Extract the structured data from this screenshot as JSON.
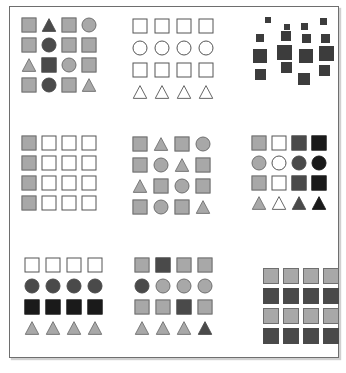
{
  "figure": {
    "width": 346,
    "height": 373,
    "frame": {
      "border_color": "#6e6e6e",
      "background": "#ffffff",
      "shadow_color": "#aaaaaa"
    },
    "palette": {
      "white": "#ffffff",
      "light_gray": "#a8a8a8",
      "mid_gray": "#8f8f8f",
      "dark_gray": "#4a4a4a",
      "darker_gray": "#3c3c3c",
      "black": "#1a1a1a",
      "outline": "#555555"
    },
    "legend_note": "Shapes: square, circle, triangle. Fills: white, light gray, dark gray, black."
  },
  "panels": [
    {
      "id": "panel-1",
      "position": "top-left",
      "label": "Mixed shapes, mixed fills",
      "layout": "grid-4x4",
      "rows": [
        [
          {
            "shape": "square",
            "fill": "light_gray"
          },
          {
            "shape": "triangle",
            "fill": "dark_gray"
          },
          {
            "shape": "square",
            "fill": "light_gray"
          },
          {
            "shape": "circle",
            "fill": "light_gray"
          }
        ],
        [
          {
            "shape": "square",
            "fill": "light_gray"
          },
          {
            "shape": "circle",
            "fill": "dark_gray"
          },
          {
            "shape": "square",
            "fill": "light_gray"
          },
          {
            "shape": "square",
            "fill": "light_gray"
          }
        ],
        [
          {
            "shape": "triangle",
            "fill": "light_gray"
          },
          {
            "shape": "square",
            "fill": "dark_gray"
          },
          {
            "shape": "circle",
            "fill": "light_gray"
          },
          {
            "shape": "square",
            "fill": "light_gray"
          }
        ],
        [
          {
            "shape": "square",
            "fill": "light_gray"
          },
          {
            "shape": "circle",
            "fill": "dark_gray"
          },
          {
            "shape": "square",
            "fill": "light_gray"
          },
          {
            "shape": "triangle",
            "fill": "light_gray"
          }
        ]
      ]
    },
    {
      "id": "panel-2",
      "position": "top-center",
      "label": "Uniform outlined shapes by row",
      "layout": "grid-4x4",
      "rows": [
        [
          {
            "shape": "square",
            "fill": "white"
          },
          {
            "shape": "square",
            "fill": "white"
          },
          {
            "shape": "square",
            "fill": "white"
          },
          {
            "shape": "square",
            "fill": "white"
          }
        ],
        [
          {
            "shape": "circle",
            "fill": "white"
          },
          {
            "shape": "circle",
            "fill": "white"
          },
          {
            "shape": "circle",
            "fill": "white"
          },
          {
            "shape": "circle",
            "fill": "white"
          }
        ],
        [
          {
            "shape": "square",
            "fill": "white"
          },
          {
            "shape": "square",
            "fill": "white"
          },
          {
            "shape": "square",
            "fill": "white"
          },
          {
            "shape": "square",
            "fill": "white"
          }
        ],
        [
          {
            "shape": "triangle",
            "fill": "white"
          },
          {
            "shape": "triangle",
            "fill": "white"
          },
          {
            "shape": "triangle",
            "fill": "white"
          },
          {
            "shape": "triangle",
            "fill": "white"
          }
        ]
      ]
    },
    {
      "id": "panel-3",
      "position": "top-right",
      "label": "Scattered dark squares of varying size",
      "layout": "scatter",
      "items": [
        {
          "shape": "square",
          "fill": "darker_gray",
          "x": 14,
          "y": 2,
          "size": 6
        },
        {
          "shape": "square",
          "fill": "darker_gray",
          "x": 33,
          "y": 9,
          "size": 6
        },
        {
          "shape": "square",
          "fill": "darker_gray",
          "x": 50,
          "y": 8,
          "size": 7
        },
        {
          "shape": "square",
          "fill": "darker_gray",
          "x": 69,
          "y": 3,
          "size": 7
        },
        {
          "shape": "square",
          "fill": "darker_gray",
          "x": 5,
          "y": 19,
          "size": 8
        },
        {
          "shape": "square",
          "fill": "darker_gray",
          "x": 30,
          "y": 16,
          "size": 10
        },
        {
          "shape": "square",
          "fill": "darker_gray",
          "x": 51,
          "y": 19,
          "size": 9
        },
        {
          "shape": "square",
          "fill": "darker_gray",
          "x": 70,
          "y": 19,
          "size": 9
        },
        {
          "shape": "square",
          "fill": "darker_gray",
          "x": 2,
          "y": 34,
          "size": 14
        },
        {
          "shape": "square",
          "fill": "darker_gray",
          "x": 26,
          "y": 30,
          "size": 15
        },
        {
          "shape": "square",
          "fill": "darker_gray",
          "x": 48,
          "y": 34,
          "size": 14
        },
        {
          "shape": "square",
          "fill": "darker_gray",
          "x": 68,
          "y": 31,
          "size": 15
        },
        {
          "shape": "square",
          "fill": "darker_gray",
          "x": 30,
          "y": 47,
          "size": 11
        },
        {
          "shape": "square",
          "fill": "darker_gray",
          "x": 4,
          "y": 54,
          "size": 11
        },
        {
          "shape": "square",
          "fill": "darker_gray",
          "x": 68,
          "y": 50,
          "size": 11
        },
        {
          "shape": "square",
          "fill": "darker_gray",
          "x": 47,
          "y": 58,
          "size": 12
        }
      ]
    },
    {
      "id": "panel-4",
      "position": "middle-left",
      "label": "Squares with first column filled",
      "layout": "grid-4x4",
      "rows": [
        [
          {
            "shape": "square",
            "fill": "light_gray"
          },
          {
            "shape": "square",
            "fill": "white"
          },
          {
            "shape": "square",
            "fill": "white"
          },
          {
            "shape": "square",
            "fill": "white"
          }
        ],
        [
          {
            "shape": "square",
            "fill": "light_gray"
          },
          {
            "shape": "square",
            "fill": "white"
          },
          {
            "shape": "square",
            "fill": "white"
          },
          {
            "shape": "square",
            "fill": "white"
          }
        ],
        [
          {
            "shape": "square",
            "fill": "light_gray"
          },
          {
            "shape": "square",
            "fill": "white"
          },
          {
            "shape": "square",
            "fill": "white"
          },
          {
            "shape": "square",
            "fill": "white"
          }
        ],
        [
          {
            "shape": "square",
            "fill": "light_gray"
          },
          {
            "shape": "square",
            "fill": "white"
          },
          {
            "shape": "square",
            "fill": "white"
          },
          {
            "shape": "square",
            "fill": "white"
          }
        ]
      ]
    },
    {
      "id": "panel-5",
      "position": "middle-center",
      "label": "Mixed shapes, uniform gray fill",
      "layout": "grid-4x4",
      "rows": [
        [
          {
            "shape": "square",
            "fill": "light_gray"
          },
          {
            "shape": "triangle",
            "fill": "light_gray"
          },
          {
            "shape": "square",
            "fill": "light_gray"
          },
          {
            "shape": "circle",
            "fill": "light_gray"
          }
        ],
        [
          {
            "shape": "square",
            "fill": "light_gray"
          },
          {
            "shape": "circle",
            "fill": "light_gray"
          },
          {
            "shape": "triangle",
            "fill": "light_gray"
          },
          {
            "shape": "square",
            "fill": "light_gray"
          }
        ],
        [
          {
            "shape": "triangle",
            "fill": "light_gray"
          },
          {
            "shape": "square",
            "fill": "light_gray"
          },
          {
            "shape": "circle",
            "fill": "light_gray"
          },
          {
            "shape": "square",
            "fill": "light_gray"
          }
        ],
        [
          {
            "shape": "square",
            "fill": "light_gray"
          },
          {
            "shape": "circle",
            "fill": "light_gray"
          },
          {
            "shape": "square",
            "fill": "light_gray"
          },
          {
            "shape": "triangle",
            "fill": "light_gray"
          }
        ]
      ]
    },
    {
      "id": "panel-6",
      "position": "middle-right",
      "label": "Shapes by row, fill gradient by column",
      "layout": "grid-4x4",
      "rows": [
        [
          {
            "shape": "square",
            "fill": "light_gray"
          },
          {
            "shape": "square",
            "fill": "white"
          },
          {
            "shape": "square",
            "fill": "dark_gray"
          },
          {
            "shape": "square",
            "fill": "black"
          }
        ],
        [
          {
            "shape": "circle",
            "fill": "light_gray"
          },
          {
            "shape": "circle",
            "fill": "white"
          },
          {
            "shape": "circle",
            "fill": "dark_gray"
          },
          {
            "shape": "circle",
            "fill": "black"
          }
        ],
        [
          {
            "shape": "square",
            "fill": "light_gray"
          },
          {
            "shape": "square",
            "fill": "white"
          },
          {
            "shape": "square",
            "fill": "dark_gray"
          },
          {
            "shape": "square",
            "fill": "black"
          }
        ],
        [
          {
            "shape": "triangle",
            "fill": "light_gray"
          },
          {
            "shape": "triangle",
            "fill": "white"
          },
          {
            "shape": "triangle",
            "fill": "dark_gray"
          },
          {
            "shape": "triangle",
            "fill": "black"
          }
        ]
      ]
    },
    {
      "id": "panel-7",
      "position": "bottom-left",
      "label": "Shapes and fills vary by row",
      "layout": "grid-4x4",
      "rows": [
        [
          {
            "shape": "square",
            "fill": "white"
          },
          {
            "shape": "square",
            "fill": "white"
          },
          {
            "shape": "square",
            "fill": "white"
          },
          {
            "shape": "square",
            "fill": "white"
          }
        ],
        [
          {
            "shape": "circle",
            "fill": "dark_gray"
          },
          {
            "shape": "circle",
            "fill": "dark_gray"
          },
          {
            "shape": "circle",
            "fill": "dark_gray"
          },
          {
            "shape": "circle",
            "fill": "dark_gray"
          }
        ],
        [
          {
            "shape": "square",
            "fill": "black"
          },
          {
            "shape": "square",
            "fill": "black"
          },
          {
            "shape": "square",
            "fill": "black"
          },
          {
            "shape": "square",
            "fill": "black"
          }
        ],
        [
          {
            "shape": "triangle",
            "fill": "light_gray"
          },
          {
            "shape": "triangle",
            "fill": "light_gray"
          },
          {
            "shape": "triangle",
            "fill": "light_gray"
          },
          {
            "shape": "triangle",
            "fill": "light_gray"
          }
        ]
      ]
    },
    {
      "id": "panel-8",
      "position": "bottom-center",
      "label": "Shapes by row with one dark odd-one-out each",
      "layout": "grid-4x4",
      "rows": [
        [
          {
            "shape": "square",
            "fill": "light_gray"
          },
          {
            "shape": "square",
            "fill": "dark_gray"
          },
          {
            "shape": "square",
            "fill": "light_gray"
          },
          {
            "shape": "square",
            "fill": "light_gray"
          }
        ],
        [
          {
            "shape": "circle",
            "fill": "dark_gray"
          },
          {
            "shape": "circle",
            "fill": "light_gray"
          },
          {
            "shape": "circle",
            "fill": "light_gray"
          },
          {
            "shape": "circle",
            "fill": "light_gray"
          }
        ],
        [
          {
            "shape": "square",
            "fill": "light_gray"
          },
          {
            "shape": "square",
            "fill": "light_gray"
          },
          {
            "shape": "square",
            "fill": "dark_gray"
          },
          {
            "shape": "square",
            "fill": "light_gray"
          }
        ],
        [
          {
            "shape": "triangle",
            "fill": "light_gray"
          },
          {
            "shape": "triangle",
            "fill": "light_gray"
          },
          {
            "shape": "triangle",
            "fill": "light_gray"
          },
          {
            "shape": "triangle",
            "fill": "dark_gray"
          }
        ]
      ]
    },
    {
      "id": "panel-9",
      "position": "bottom-right",
      "label": "Squares with alternating row fills",
      "layout": "grid-4x4",
      "rows": [
        [
          {
            "shape": "square",
            "fill": "light_gray"
          },
          {
            "shape": "square",
            "fill": "light_gray"
          },
          {
            "shape": "square",
            "fill": "light_gray"
          },
          {
            "shape": "square",
            "fill": "light_gray"
          }
        ],
        [
          {
            "shape": "square",
            "fill": "dark_gray"
          },
          {
            "shape": "square",
            "fill": "dark_gray"
          },
          {
            "shape": "square",
            "fill": "dark_gray"
          },
          {
            "shape": "square",
            "fill": "dark_gray"
          }
        ],
        [
          {
            "shape": "square",
            "fill": "light_gray"
          },
          {
            "shape": "square",
            "fill": "light_gray"
          },
          {
            "shape": "square",
            "fill": "light_gray"
          },
          {
            "shape": "square",
            "fill": "light_gray"
          }
        ],
        [
          {
            "shape": "square",
            "fill": "dark_gray"
          },
          {
            "shape": "square",
            "fill": "dark_gray"
          },
          {
            "shape": "square",
            "fill": "dark_gray"
          },
          {
            "shape": "square",
            "fill": "dark_gray"
          }
        ]
      ]
    }
  ],
  "panel_geometry": {
    "panel-1": {
      "left": 18,
      "top": 14,
      "cell": 20,
      "shape": 15
    },
    "panel-2": {
      "left": 128,
      "top": 14,
      "cell": 22,
      "shape": 15
    },
    "panel-3": {
      "left": 250,
      "top": 14,
      "width": 90,
      "height": 80
    },
    "panel-4": {
      "left": 18,
      "top": 132,
      "cell": 20,
      "shape": 15
    },
    "panel-5": {
      "left": 128,
      "top": 132,
      "cell": 21,
      "shape": 15
    },
    "panel-6": {
      "left": 248,
      "top": 132,
      "cell": 20,
      "shape": 15
    },
    "panel-7": {
      "left": 20,
      "top": 253,
      "cell": 21,
      "shape": 15
    },
    "panel-8": {
      "left": 130,
      "top": 253,
      "cell": 21,
      "shape": 15
    },
    "panel-9": {
      "left": 260,
      "top": 265,
      "cell": 20,
      "shape": 16
    }
  }
}
